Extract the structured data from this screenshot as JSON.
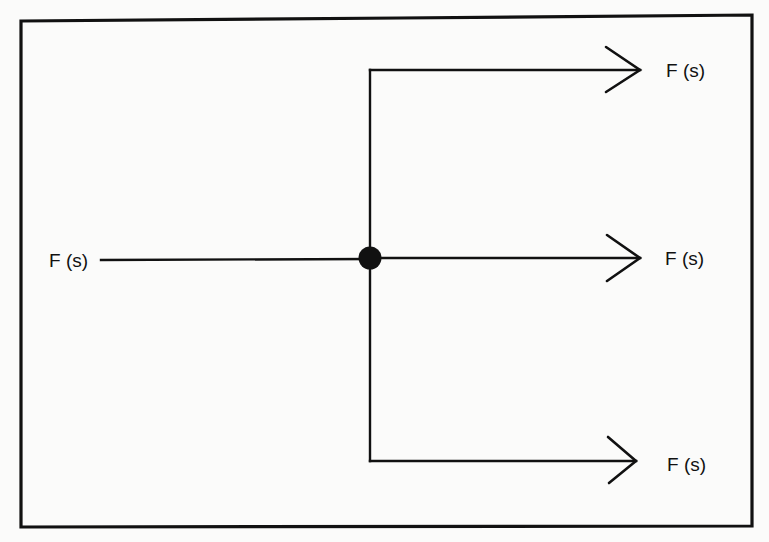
{
  "diagram": {
    "input": {
      "label": "F (s)"
    },
    "branch_point": {
      "type": "pickoff-node"
    },
    "outputs": [
      {
        "label": "F (s)",
        "position": "top"
      },
      {
        "label": "F (s)",
        "position": "middle"
      },
      {
        "label": "F (s)",
        "position": "bottom"
      }
    ],
    "connections": [
      {
        "from": "input",
        "to": "branch_point"
      },
      {
        "from": "branch_point",
        "to": "outputs.0"
      },
      {
        "from": "branch_point",
        "to": "outputs.1"
      },
      {
        "from": "branch_point",
        "to": "outputs.2"
      }
    ],
    "colors": {
      "stroke": "#111111",
      "background": "#fbfbfa"
    }
  }
}
